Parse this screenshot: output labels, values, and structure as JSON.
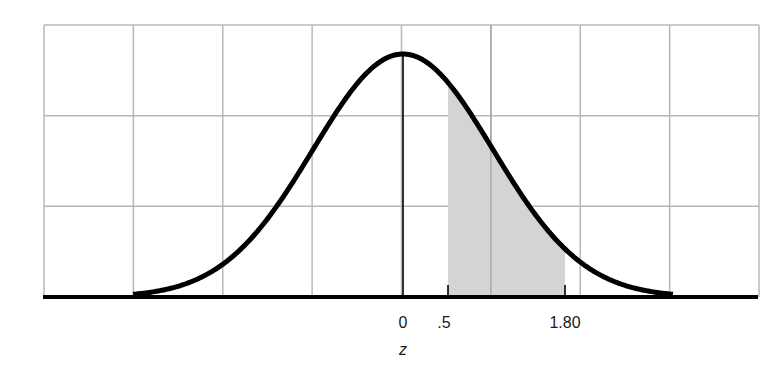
{
  "chart_data": {
    "type": "area",
    "title": "",
    "xlabel": "z",
    "ylabel": "",
    "xlim": [
      -3,
      3
    ],
    "grid": true,
    "grid_columns": 8,
    "grid_rows": 3,
    "curve": {
      "name": "standard normal density",
      "mean": 0,
      "sd": 1
    },
    "shaded_region": {
      "from": 0.5,
      "to": 1.8,
      "color": "#d4d4d4"
    },
    "tick_labels": [
      {
        "value": 0,
        "label": "0"
      },
      {
        "value": 0.5,
        "label": ".5"
      },
      {
        "value": 1.8,
        "label": "1.80"
      }
    ],
    "axis_label": "z",
    "colors": {
      "curve": "#000000",
      "grid": "#b8b8b8",
      "shade": "#d4d4d4"
    }
  }
}
